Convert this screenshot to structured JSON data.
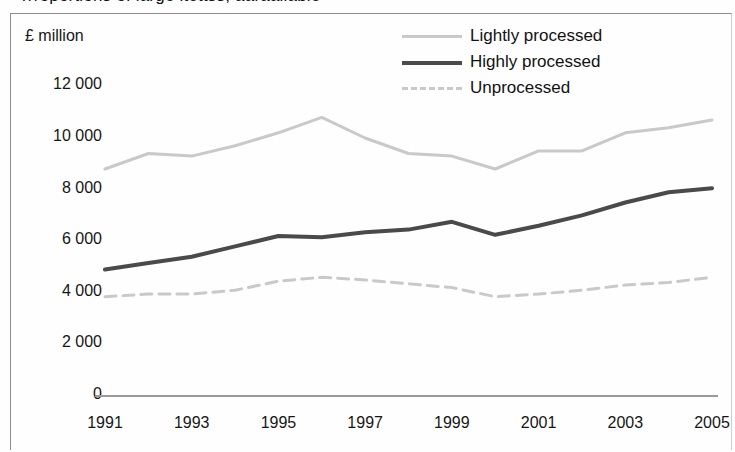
{
  "figure": {
    "title_sliver": "rrroportions of large ltettss, aaraailable",
    "frame_visible": true
  },
  "axes": {
    "y_axis_unit_label": "£ million",
    "y_ticks": [
      "0",
      "2 000",
      "4 000",
      "6 000",
      "8 000",
      "10 000",
      "12 000"
    ],
    "x_ticks": [
      "1991",
      "1993",
      "1995",
      "1997",
      "1999",
      "2001",
      "2003",
      "2005"
    ]
  },
  "legend": {
    "position": "top-right",
    "items": [
      {
        "label": "Lightly processed",
        "style": "solid",
        "color": "#c9c9c9",
        "swatch": "line-swatch-light"
      },
      {
        "label": "Highly processed",
        "style": "solid",
        "color": "#4a4a4a",
        "swatch": "line-swatch-dark"
      },
      {
        "label": "Unprocessed",
        "style": "dashed",
        "color": "#c9c9c9",
        "swatch": "line-swatch-dashed"
      }
    ]
  },
  "chart_data": {
    "type": "line",
    "title": "",
    "xlabel": "",
    "ylabel": "£ million",
    "ylim": [
      0,
      12000
    ],
    "ytick_step": 2000,
    "grid": false,
    "x": [
      1991,
      1992,
      1993,
      1994,
      1995,
      1996,
      1997,
      1998,
      1999,
      2000,
      2001,
      2002,
      2003,
      2004,
      2005
    ],
    "xtick_labels": [
      "1991",
      "1993",
      "1995",
      "1997",
      "1999",
      "2001",
      "2003",
      "2005"
    ],
    "series": [
      {
        "name": "Lightly processed",
        "color": "#c9c9c9",
        "style": "solid",
        "width": 3,
        "values": [
          8800,
          9400,
          9300,
          9700,
          10200,
          10800,
          10000,
          9400,
          9300,
          8800,
          9500,
          9500,
          10200,
          10400,
          10700
        ]
      },
      {
        "name": "Highly processed",
        "color": "#4a4a4a",
        "style": "solid",
        "width": 4,
        "values": [
          4900,
          5150,
          5400,
          5800,
          6200,
          6150,
          6350,
          6450,
          6750,
          6250,
          6600,
          7000,
          7500,
          7900,
          8050
        ]
      },
      {
        "name": "Unprocessed",
        "color": "#c9c9c9",
        "style": "dashed",
        "width": 3,
        "values": [
          3850,
          3950,
          3950,
          4100,
          4450,
          4600,
          4500,
          4350,
          4200,
          3850,
          3950,
          4100,
          4300,
          4400,
          4600
        ]
      }
    ]
  },
  "geometry": {
    "plot_left_px": 105,
    "plot_right_px": 712,
    "y_zero_px": 396,
    "px_per_2000": 51.6
  }
}
